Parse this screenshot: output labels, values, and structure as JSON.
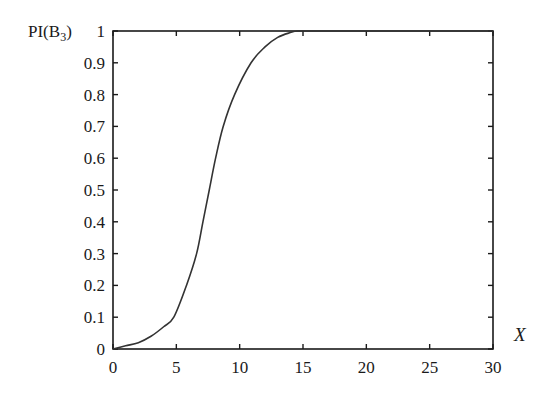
{
  "chart_data": {
    "type": "line",
    "title": "",
    "xlabel": "X",
    "ylabel": "PI(B3)",
    "ylabel_main": "PI(B",
    "ylabel_sub": "3",
    "ylabel_close": ")",
    "xlim": [
      0,
      30
    ],
    "ylim": [
      0,
      1
    ],
    "grid": false,
    "legend": null,
    "xticks": [
      0,
      5,
      10,
      15,
      20,
      25,
      30
    ],
    "xtick_labels": [
      "0",
      "5",
      "10",
      "15",
      "20",
      "25",
      "30"
    ],
    "yticks": [
      0,
      0.1,
      0.2,
      0.3,
      0.4,
      0.5,
      0.6,
      0.7,
      0.8,
      0.9,
      1
    ],
    "ytick_labels": [
      "0",
      "0.1",
      "0.2",
      "0.3",
      "0.4",
      "0.5",
      "0.6",
      "0.7",
      "0.8",
      "0.9",
      "1"
    ],
    "series": [
      {
        "name": "PI(B3)",
        "color": "#333333",
        "x": [
          0,
          1,
          2,
          3,
          4,
          4.8,
          5.8,
          6.6,
          7.1,
          7.6,
          8.1,
          8.7,
          9.6,
          10.9,
          12,
          13,
          14,
          14.6,
          16,
          20,
          25,
          30
        ],
        "y": [
          0.0,
          0.01,
          0.02,
          0.04,
          0.07,
          0.1,
          0.2,
          0.3,
          0.4,
          0.5,
          0.6,
          0.7,
          0.8,
          0.9,
          0.95,
          0.98,
          0.995,
          1.0,
          1.0,
          1.0,
          1.0,
          1.0
        ]
      }
    ]
  }
}
